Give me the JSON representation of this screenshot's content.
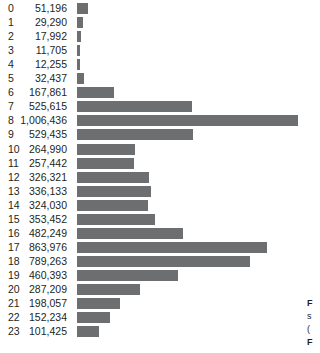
{
  "chart_data": {
    "type": "bar",
    "orientation": "horizontal",
    "title": "",
    "xlabel": "",
    "ylabel": "",
    "grid": false,
    "legend": null,
    "xlim": [
      0,
      1006436
    ],
    "categories": [
      "0",
      "1",
      "2",
      "3",
      "4",
      "5",
      "6",
      "7",
      "8",
      "9",
      "10",
      "11",
      "12",
      "13",
      "14",
      "15",
      "16",
      "17",
      "18",
      "19",
      "20",
      "21",
      "22",
      "23"
    ],
    "values": [
      51196,
      29290,
      17992,
      11705,
      12255,
      32437,
      167861,
      525615,
      1006436,
      529435,
      264990,
      257442,
      326321,
      336133,
      324030,
      353452,
      482249,
      863976,
      789263,
      460393,
      287209,
      198057,
      152234,
      101425
    ],
    "value_labels": [
      "51,196",
      "29,290",
      "17,992",
      "11,705",
      "12,255",
      "32,437",
      "167,861",
      "525,615",
      "1,006,436",
      "529,435",
      "264,990",
      "257,442",
      "326,321",
      "336,133",
      "324,030",
      "353,452",
      "482,249",
      "863,976",
      "789,263",
      "460,393",
      "287,209",
      "198,057",
      "152,234",
      "101,425"
    ],
    "bar_color": "#6d6e70",
    "background_color": "#ffffff",
    "text_color": "#231f20"
  },
  "caption": {
    "lines": [
      "F",
      "s",
      "(",
      "F"
    ]
  }
}
